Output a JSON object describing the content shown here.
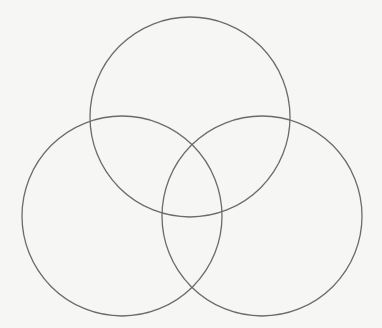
{
  "diagram": {
    "type": "venn",
    "set_count": 3,
    "background_color": "#f6f6f5",
    "stroke_color": "#6b6b6b",
    "stroke_width": 1.3,
    "circles": [
      {
        "name": "top",
        "cx": 190,
        "cy": 117,
        "r": 100,
        "label": ""
      },
      {
        "name": "bottom-left",
        "cx": 122,
        "cy": 216,
        "r": 100,
        "label": ""
      },
      {
        "name": "bottom-right",
        "cx": 262,
        "cy": 216,
        "r": 100,
        "label": ""
      }
    ]
  }
}
